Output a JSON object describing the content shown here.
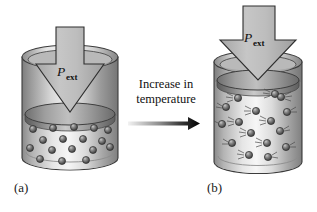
{
  "figure": {
    "type": "diagram",
    "background_color": "#ffffff",
    "panels": [
      {
        "id": "a",
        "label": "(a)",
        "state": "low-temperature",
        "pressure_label": {
          "symbol": "P",
          "subscript": "ext"
        },
        "piston_height_fraction": 0.45,
        "particle_count": 17,
        "particles_have_motion_lines": false,
        "cylinder": {
          "x": 22,
          "y": 47,
          "width": 96,
          "height": 122,
          "body_color": "#b8b8b8",
          "highlight_color": "#ececec",
          "shadow_color": "#8a8a8a",
          "outline_color": "#3a3a3a"
        },
        "piston_plate_color": "#9a9a9a",
        "arrow_fill": "#b5b5b5",
        "arrow_outline": "#2e2e2e"
      },
      {
        "id": "b",
        "label": "(b)",
        "state": "high-temperature",
        "pressure_label": {
          "symbol": "P",
          "subscript": "ext"
        },
        "piston_height_fraction": 0.86,
        "particle_count": 16,
        "particles_have_motion_lines": true,
        "cylinder": {
          "x": 213,
          "y": 52,
          "width": 88,
          "height": 122,
          "body_color": "#b8b8b8",
          "highlight_color": "#ececec",
          "shadow_color": "#8a8a8a",
          "outline_color": "#3a3a3a"
        },
        "piston_plate_color": "#9a9a9a",
        "arrow_fill": "#b5b5b5",
        "arrow_outline": "#2e2e2e"
      }
    ],
    "transition": {
      "caption_line_1": "Increase in",
      "caption_line_2": "temperature",
      "arrow": {
        "direction": "right",
        "gradient_from": "#efefef",
        "gradient_to": "#000000",
        "x": 128,
        "y": 118,
        "length": 72
      }
    },
    "colors": {
      "sphere_dark": "#4c4c4c",
      "sphere_mid": "#6e6e6e",
      "sphere_light": "#a9a9a9",
      "sphere_outline": "#2b2b2b",
      "gas_region": "#e6e6e6",
      "text": "#111111"
    }
  }
}
